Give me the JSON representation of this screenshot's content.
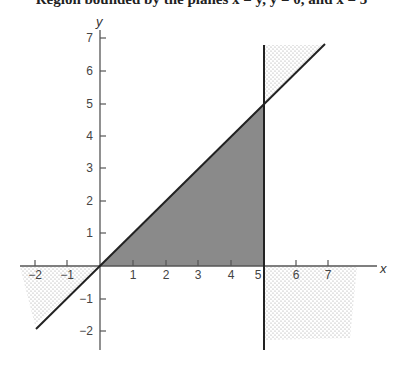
{
  "caption": "Region bounded by the planes x = y, y = 0, and x = 5",
  "colors": {
    "shade": "#8a8a8a",
    "line": "#222222",
    "dots": "#9a9a9a"
  },
  "axes": {
    "x_label": "x",
    "y_label": "y",
    "x_ticks": [
      "−2",
      "−1",
      "1",
      "2",
      "3",
      "4",
      "5",
      "6",
      "7"
    ],
    "y_ticks": [
      "−2",
      "−1",
      "1",
      "2",
      "3",
      "4",
      "5",
      "6",
      "7"
    ]
  },
  "lines": [
    {
      "name": "y = x",
      "from": [
        -1.9,
        -1.9
      ],
      "to": [
        7,
        7
      ]
    },
    {
      "name": "x = 5",
      "from": [
        5,
        -2.8
      ],
      "to": [
        5,
        6.8
      ]
    }
  ],
  "shaded_region": {
    "vertices": [
      [
        0,
        0
      ],
      [
        5,
        0
      ],
      [
        5,
        5
      ]
    ],
    "description": "triangle 0 ≤ y ≤ x ≤ 5"
  }
}
